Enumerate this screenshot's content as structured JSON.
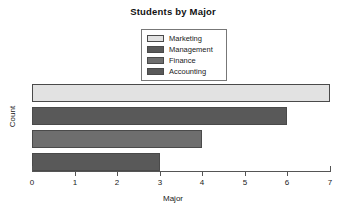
{
  "chart_data": {
    "type": "bar",
    "orientation": "horizontal",
    "title": "Students by Major",
    "xlabel": "Major",
    "ylabel": "Count",
    "categories": [
      "Marketing",
      "Management",
      "Finance",
      "Accounting"
    ],
    "values": [
      7,
      6,
      4,
      3
    ],
    "colors": [
      "#e2e2e2",
      "#595959",
      "#6e6e6e",
      "#595959"
    ],
    "xlim": [
      0,
      7
    ],
    "xticks": [
      0,
      1,
      2,
      3,
      4,
      5,
      6,
      7
    ],
    "xtick_labels": [
      "0",
      "1",
      "2",
      "3",
      "4",
      "5",
      "6",
      "7"
    ],
    "grid": false,
    "legend_position": "top-center",
    "legend_entries": [
      {
        "label": "Marketing",
        "color": "#e2e2e2"
      },
      {
        "label": "Management",
        "color": "#595959"
      },
      {
        "label": "Finance",
        "color": "#6e6e6e"
      },
      {
        "label": "Accounting",
        "color": "#595959"
      }
    ]
  }
}
